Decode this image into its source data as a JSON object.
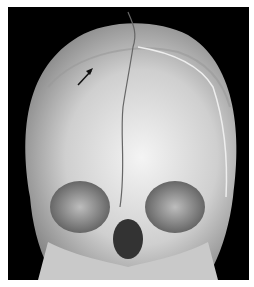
{
  "image": {
    "subject": "3D CT reconstruction of infant skull, frontal view",
    "annotations": [
      {
        "type": "arrow",
        "direction": "up-right",
        "position": "upper-left forehead"
      }
    ],
    "colors": {
      "background": "#000000",
      "border": "#ffffff",
      "bone": "#d8d8d8"
    }
  }
}
